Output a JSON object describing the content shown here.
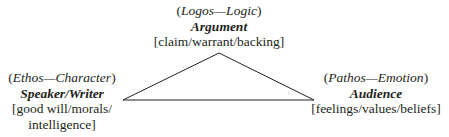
{
  "diagram": {
    "type": "rhetorical-triangle",
    "nodes": {
      "top": {
        "appeal_open": "(",
        "appeal": "Logos—Logic",
        "appeal_close": ")",
        "title": "Argument",
        "details": "[claim/warrant/backing]"
      },
      "left": {
        "appeal_open": "(",
        "appeal": "Ethos—Character",
        "appeal_close": ")",
        "title": "Speaker/Writer",
        "details_line1": "[good will/morals/",
        "details_line2": "intelligence]"
      },
      "right": {
        "appeal_open": "(",
        "appeal": "Pathos—Emotion",
        "appeal_close": ")",
        "title": "Audience",
        "details": "[feelings/values/beliefs]"
      }
    },
    "triangle": {
      "apex": [
        219,
        53
      ],
      "left": [
        123,
        100
      ],
      "right": [
        314,
        100
      ],
      "stroke": "#231f20"
    }
  }
}
